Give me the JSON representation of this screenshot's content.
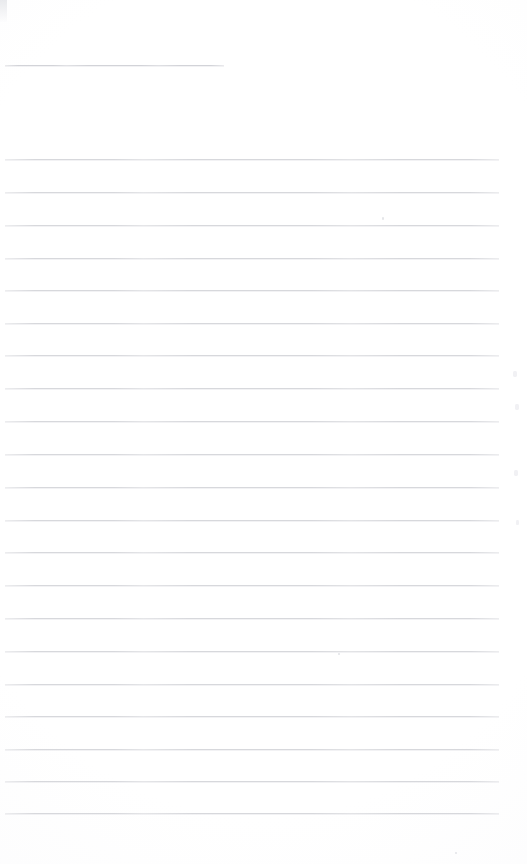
{
  "document": {
    "kind": "scanned-lined-paper",
    "title": "",
    "body_text": "",
    "page_width": 527,
    "page_height": 864,
    "background_color": "#ffffff",
    "rule_color": "#d7d8dc",
    "is_blank": "true",
    "blank_note": ""
  },
  "ruling": {
    "left_margin_x": 5,
    "right_edge_x": 499,
    "line_spacing": 32.4,
    "body_line_count": 21,
    "first_body_line_y": 159,
    "last_body_line_y": 813
  },
  "title_rule": {
    "label": "",
    "x": 5,
    "y": 65,
    "width": 219,
    "color": "#d2d3d8"
  },
  "body_rules": [
    {
      "y": 159,
      "x": 5,
      "width": 494
    },
    {
      "y": 192,
      "x": 5,
      "width": 494
    },
    {
      "y": 225,
      "x": 5,
      "width": 494
    },
    {
      "y": 258,
      "x": 5,
      "width": 494
    },
    {
      "y": 290,
      "x": 5,
      "width": 494
    },
    {
      "y": 323,
      "x": 5,
      "width": 494
    },
    {
      "y": 355,
      "x": 5,
      "width": 494
    },
    {
      "y": 388,
      "x": 5,
      "width": 494
    },
    {
      "y": 421,
      "x": 5,
      "width": 494
    },
    {
      "y": 454,
      "x": 5,
      "width": 494
    },
    {
      "y": 487,
      "x": 5,
      "width": 494
    },
    {
      "y": 520,
      "x": 5,
      "width": 494
    },
    {
      "y": 552,
      "x": 5,
      "width": 494
    },
    {
      "y": 585,
      "x": 5,
      "width": 494
    },
    {
      "y": 618,
      "x": 5,
      "width": 494
    },
    {
      "y": 651,
      "x": 5,
      "width": 494
    },
    {
      "y": 684,
      "x": 5,
      "width": 494
    },
    {
      "y": 716,
      "x": 5,
      "width": 494
    },
    {
      "y": 749,
      "x": 5,
      "width": 494
    },
    {
      "y": 781,
      "x": 5,
      "width": 494
    },
    {
      "y": 813,
      "x": 5,
      "width": 494
    }
  ],
  "artifacts": [
    {
      "name": "corner-smudge",
      "type": "smudge",
      "x": 0,
      "y": 0,
      "w": 7,
      "h": 22
    },
    {
      "name": "speck-upper-right",
      "type": "speck",
      "x": 382,
      "y": 217,
      "w": 2,
      "h": 3
    },
    {
      "name": "fleck-right-1",
      "type": "fleck",
      "x": 513,
      "y": 371,
      "w": 4,
      "h": 6
    },
    {
      "name": "fleck-right-2",
      "type": "fleck",
      "x": 515,
      "y": 404,
      "w": 4,
      "h": 6
    },
    {
      "name": "fleck-right-3",
      "type": "fleck",
      "x": 514,
      "y": 470,
      "w": 4,
      "h": 6
    },
    {
      "name": "fleck-right-4",
      "type": "fleck",
      "x": 516,
      "y": 520,
      "w": 3,
      "h": 5
    },
    {
      "name": "speck-lower-center",
      "type": "speck",
      "x": 338,
      "y": 653,
      "w": 2,
      "h": 2
    },
    {
      "name": "speck-bottom",
      "type": "speck",
      "x": 455,
      "y": 852,
      "w": 2,
      "h": 2
    }
  ]
}
